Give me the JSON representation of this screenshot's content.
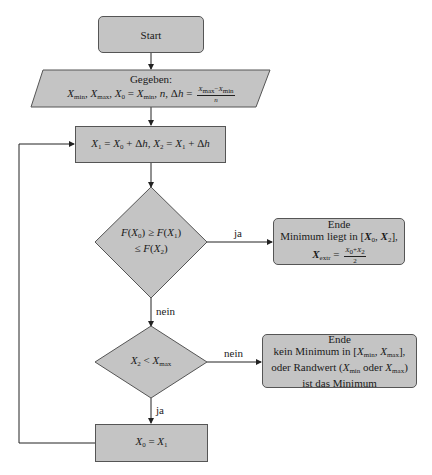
{
  "colors": {
    "fill": "#c4c4c4",
    "stroke": "#555555",
    "line": "#222222",
    "background": "#ffffff"
  },
  "nodes": {
    "start": {
      "label": "Start"
    },
    "input": {
      "title": "Gegeben:",
      "formula": "X_min, X_max, X_0 = X_min, n, Δh = (X_max − X_min)/n",
      "parts": {
        "xmin": "X",
        "xmin_sub": "min",
        "xmax": "X",
        "xmax_sub": "max",
        "x0": "X",
        "x0_sub": "0",
        "eq": " = ",
        "n": "n",
        "dh": "Δh",
        "frac_num": "X_max−X_min",
        "frac_den": "n"
      }
    },
    "step": {
      "formula": "X_1 = X_0 + Δh, X_2 = X_1 + Δh"
    },
    "decision1": {
      "line1": "F(X_0) ≥ F(X_1)",
      "line2": "≤ F(X_2)"
    },
    "end1": {
      "title": "Ende",
      "line1": "Minimum liegt in [X_0, X_2],",
      "line2": "X_extr = (X_0 + X_2)/2"
    },
    "decision2": {
      "formula": "X_2 < X_max"
    },
    "end2": {
      "title": "Ende",
      "line1": "kein Minimum in [X_min, X_max],",
      "line2": "oder Randwert (X_min oder X_max)",
      "line3": "ist das Minimum"
    },
    "update": {
      "formula": "X_0 = X_1"
    }
  },
  "edges": {
    "d1_yes": "ja",
    "d1_no": "nein",
    "d2_no": "nein",
    "d2_yes": "ja"
  }
}
